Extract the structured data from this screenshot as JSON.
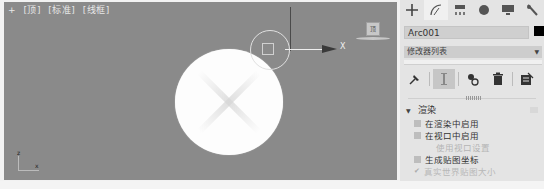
{
  "viewport": {
    "labels": [
      "+",
      "[顶]",
      "[标准]",
      "[线框]"
    ],
    "gizmo_axis_label": "X",
    "viewcube_label": "顶",
    "tripod": {
      "z": "z",
      "x": "x"
    }
  },
  "command_panel": {
    "tabs": [
      {
        "name": "create",
        "icon": "plus-icon",
        "glyph": "+"
      },
      {
        "name": "modify",
        "icon": "modify-arc-icon",
        "glyph": "◜"
      },
      {
        "name": "hierarchy",
        "icon": "hierarchy-icon",
        "glyph": "▀"
      },
      {
        "name": "motion",
        "icon": "motion-sphere-icon",
        "glyph": "●"
      },
      {
        "name": "display",
        "icon": "display-monitor-icon",
        "glyph": "▆"
      },
      {
        "name": "utilities",
        "icon": "wrench-icon",
        "glyph": "🔧"
      }
    ],
    "object_name": "Arc001",
    "object_color": "#000000",
    "modifier_list": {
      "label": "修改器列表",
      "arrow": "▼"
    },
    "tools": [
      {
        "name": "pin-stack",
        "glyph": "📌"
      },
      {
        "name": "show-end-result",
        "glyph": "Ⅰ"
      },
      {
        "name": "make-unique",
        "glyph": "⚭"
      },
      {
        "name": "remove-modifier",
        "glyph": "🗑"
      },
      {
        "name": "configure-modifier-sets",
        "glyph": "▦"
      }
    ],
    "rollout": {
      "title": "渲染",
      "options": [
        {
          "label": "在渲染中启用",
          "type": "checkbox",
          "checked": false,
          "enabled": true
        },
        {
          "label": "在视口中启用",
          "type": "checkbox",
          "checked": false,
          "enabled": true
        },
        {
          "label": "使用视口设置",
          "type": "checkbox",
          "checked": false,
          "enabled": false
        },
        {
          "label": "生成贴图坐标",
          "type": "checkbox",
          "checked": false,
          "enabled": true
        },
        {
          "label": "真实世界贴图大小",
          "type": "checkbox",
          "checked": true,
          "enabled": false
        }
      ]
    }
  },
  "colors": {
    "viewport_bg": "#8a8a8a",
    "panel_bg": "#e4e4e4",
    "shape_fill": "#fdfdfd"
  }
}
